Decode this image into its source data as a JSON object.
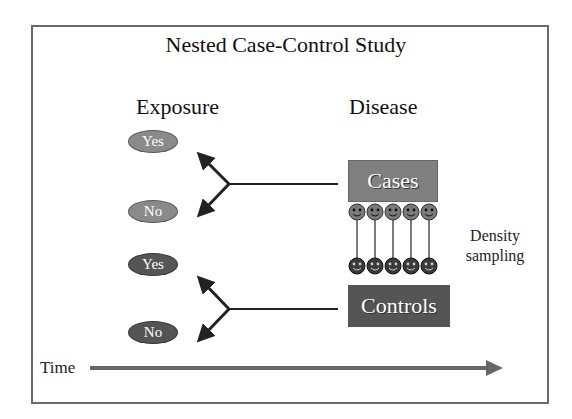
{
  "title": "Nested Case-Control Study",
  "headers": {
    "exposure": "Exposure",
    "disease": "Disease"
  },
  "exposure_nodes": [
    {
      "label": "Yes",
      "group": "cases",
      "color": "#8a8a8a"
    },
    {
      "label": "No",
      "group": "cases",
      "color": "#8a8a8a"
    },
    {
      "label": "Yes",
      "group": "controls",
      "color": "#555555"
    },
    {
      "label": "No",
      "group": "controls",
      "color": "#555555"
    }
  ],
  "disease_boxes": {
    "cases": {
      "label": "Cases",
      "color": "#808080"
    },
    "controls": {
      "label": "Controls",
      "color": "#555555"
    }
  },
  "sampling": {
    "case_faces": 5,
    "control_faces": 5,
    "case_face_color": "#7a7a7a",
    "control_face_color": "#3a3a3a",
    "note_line1": "Density",
    "note_line2": "sampling"
  },
  "time_axis": {
    "label": "Time",
    "arrow_color": "#666666"
  }
}
